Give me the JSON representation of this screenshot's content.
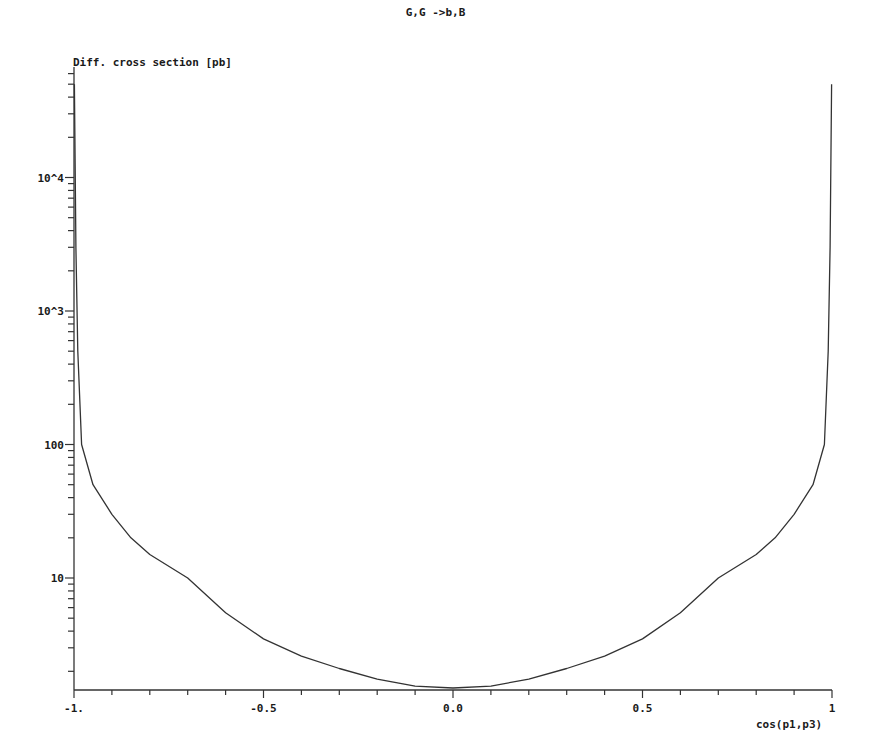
{
  "chart_data": {
    "type": "line",
    "title": "G,G ->b,B",
    "xlabel": "cos(p1,p3)",
    "ylabel": "Diff. cross section [pb]",
    "yscale": "log",
    "xlim": [
      -1,
      1
    ],
    "ylim": [
      1.45,
      66000
    ],
    "grid": false,
    "legend": null,
    "x_ticks": [
      {
        "value": -1,
        "label": "-1."
      },
      {
        "value": -0.5,
        "label": "-0.5"
      },
      {
        "value": 0,
        "label": "0.0"
      },
      {
        "value": 0.5,
        "label": "0.5"
      },
      {
        "value": 1,
        "label": "1"
      }
    ],
    "y_ticks": [
      {
        "value": 10,
        "label": "10"
      },
      {
        "value": 100,
        "label": "100"
      },
      {
        "value": 1000,
        "label": "10^3"
      },
      {
        "value": 10000,
        "label": "10^4"
      }
    ],
    "series": [
      {
        "name": "G,G ->b,B",
        "color": "#333333",
        "x": [
          -0.999,
          -0.995,
          -0.99,
          -0.98,
          -0.95,
          -0.9,
          -0.85,
          -0.8,
          -0.7,
          -0.6,
          -0.5,
          -0.4,
          -0.3,
          -0.2,
          -0.1,
          0.0,
          0.1,
          0.2,
          0.3,
          0.4,
          0.5,
          0.6,
          0.7,
          0.8,
          0.85,
          0.9,
          0.95,
          0.98,
          0.99,
          0.995,
          0.999
        ],
        "y": [
          50000,
          3000,
          500,
          100,
          50,
          30,
          20,
          15,
          10,
          5.5,
          3.5,
          2.6,
          2.1,
          1.75,
          1.55,
          1.5,
          1.55,
          1.75,
          2.1,
          2.6,
          3.5,
          5.5,
          10,
          15,
          20,
          30,
          50,
          100,
          500,
          3000,
          50000
        ]
      }
    ]
  }
}
